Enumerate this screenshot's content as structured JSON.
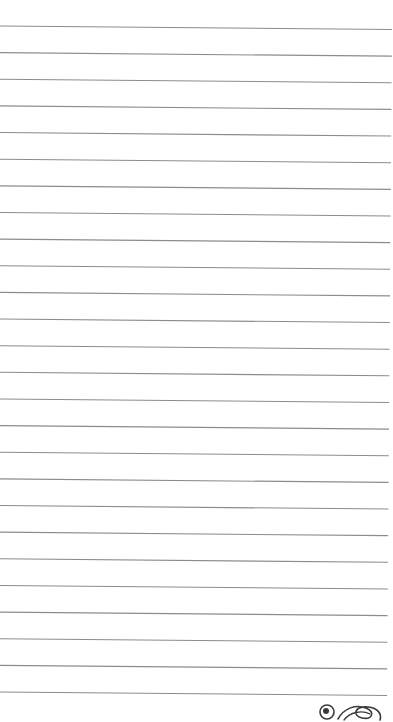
{
  "page": {
    "type": "lined-notebook-paper",
    "background_color": "#ffffff",
    "line_color": "#8c8c8c",
    "line_count": 26,
    "line_spacing_px": 26.64,
    "first_line_left_y": 26,
    "first_line_right_y": 29.5,
    "right_edge_top_x": 392,
    "right_edge_bottom_x": 387
  },
  "logo": {
    "icon": "doodle-logo-icon",
    "color": "#3a3a3a"
  }
}
